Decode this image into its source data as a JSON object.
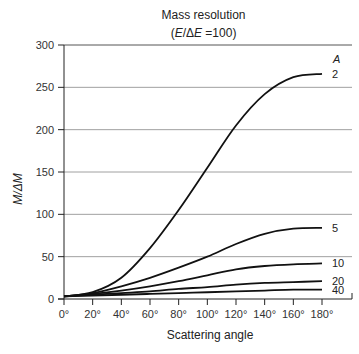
{
  "chart_data": {
    "type": "line",
    "title": "Mass resolution",
    "subtitle": "(E/ΔE =100)",
    "xlabel": "Scattering angle",
    "ylabel": "M/ΔM",
    "legend_title": "A",
    "xlim": [
      0,
      180
    ],
    "ylim": [
      0,
      300
    ],
    "grid": "horizontal",
    "x_ticks": [
      "0°",
      "20°",
      "40°",
      "60°",
      "80°",
      "100°",
      "120°",
      "140°",
      "160°",
      "180°"
    ],
    "y_ticks": [
      "0",
      "50",
      "100",
      "150",
      "200",
      "250",
      "300"
    ],
    "x": [
      0,
      20,
      40,
      60,
      80,
      100,
      120,
      140,
      160,
      180
    ],
    "series": [
      {
        "name": "2",
        "values": [
          3,
          8,
          25,
          60,
          105,
          155,
          205,
          242,
          262,
          266
        ]
      },
      {
        "name": "5",
        "values": [
          3,
          7,
          15,
          25,
          37,
          50,
          65,
          77,
          83,
          84
        ]
      },
      {
        "name": "10",
        "values": [
          3,
          6,
          10,
          15,
          21,
          28,
          35,
          39,
          41,
          42
        ]
      },
      {
        "name": "20",
        "values": [
          3,
          5,
          7,
          9,
          12,
          14,
          17,
          19,
          20,
          21
        ]
      },
      {
        "name": "40",
        "values": [
          3,
          4,
          5,
          6,
          7,
          8,
          9,
          10,
          11,
          11
        ]
      }
    ]
  },
  "labels": {
    "title": "Mass resolution",
    "subtitle_open": "(",
    "subtitle_E": "E",
    "subtitle_mid": "/Δ",
    "subtitle_E2": "E",
    "subtitle_close": " =100)",
    "xlabel": "Scattering angle",
    "ylabel": "M/ΔM",
    "legend_title": "A"
  },
  "colors": {
    "line": "#111111",
    "grid": "#888888",
    "axis": "#222222"
  }
}
